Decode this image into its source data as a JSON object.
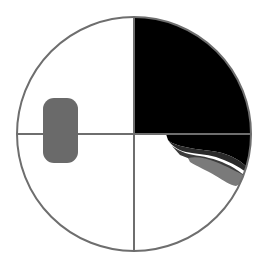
{
  "diagram": {
    "type": "quadrant-circle",
    "colors": {
      "background": "#ffffff",
      "outline": "#6e6e6e",
      "quadrant_fill": "#000000",
      "marker_fill": "#6a6a6a",
      "shade_dark": "#2a2a2a",
      "shade_mid": "#4a4a4a",
      "shade_light": "#7a7a7a"
    },
    "circle": {
      "cx": 134,
      "cy": 134,
      "r": 117
    },
    "filled_quadrant": "top-right",
    "marker": {
      "shape": "rounded-rectangle",
      "x": 43,
      "y": 98,
      "width": 35,
      "height": 65,
      "rx": 11
    },
    "shaded_region": {
      "quadrant": "bottom-right",
      "layers": [
        "black",
        "dark-gray",
        "gray"
      ]
    }
  }
}
